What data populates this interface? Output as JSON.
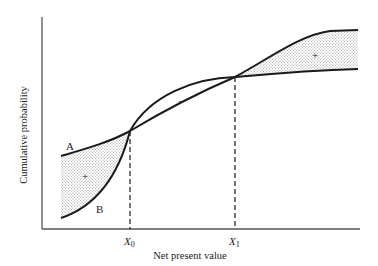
{
  "diagram": {
    "ylabel": "Cumulative probability",
    "xlabel": "Net present value",
    "x0_label": "X",
    "x0_sub": "0",
    "x1_label": "X",
    "x1_sub": "1",
    "curve_a_label": "A",
    "curve_b_label": "B",
    "region_left_sign": "+",
    "region_middle_sign": "–",
    "region_right_sign": "+",
    "colors": {
      "line": "#1a1a1a",
      "axis": "#555555",
      "shade": "#bdbdbd"
    }
  }
}
